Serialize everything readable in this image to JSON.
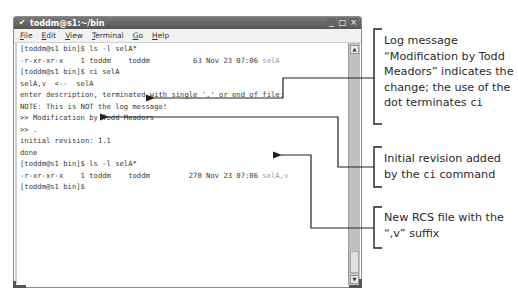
{
  "window": {
    "title": "toddm@s1:~/bin",
    "menu": [
      {
        "label": "File",
        "mnemonic": "F",
        "rest": "ile"
      },
      {
        "label": "Edit",
        "mnemonic": "E",
        "rest": "dit"
      },
      {
        "label": "View",
        "mnemonic": "V",
        "rest": "iew"
      },
      {
        "label": "Terminal",
        "mnemonic": "T",
        "rest": "erminal"
      },
      {
        "label": "Go",
        "mnemonic": "G",
        "rest": "o"
      },
      {
        "label": "Help",
        "mnemonic": "H",
        "rest": "elp"
      }
    ],
    "controls": {
      "minimize": "_",
      "maximize": "□",
      "close": "×"
    }
  },
  "terminal": {
    "lines": [
      {
        "text": "[toddm@s1 bin]$ ls -l selA*"
      },
      {
        "text": "-r-xr-xr-x    1 toddm    toddm          63 Nov 23 07:06 ",
        "dim": "selA"
      },
      {
        "text": "[toddm@s1 bin]$ ci selA"
      },
      {
        "text": "selA,v  <--  selA"
      },
      {
        "text": "enter description, terminated with single '.' or end of file:"
      },
      {
        "text": "NOTE: This is NOT the log message!"
      },
      {
        "text": ">> Modification by Todd Meadors"
      },
      {
        "text": ">> ."
      },
      {
        "text": "initial revision: 1.1"
      },
      {
        "text": "done"
      },
      {
        "text": "[toddm@s1 bin]$ ls -l selA*"
      },
      {
        "text": "-r-xr-xr-x    1 toddm    toddm         270 Nov 23 07:06 ",
        "dim": "selA,v"
      },
      {
        "text": "[toddm@s1 bin]$"
      }
    ]
  },
  "annotations": [
    {
      "text_before": "Log message “Modification by Todd Meadors” indicates the change; the use of the dot terminates ",
      "code": "ci",
      "text_after": ""
    },
    {
      "text_before": "Initial revision added by the ",
      "code": "ci",
      "text_after": " command"
    },
    {
      "text_before": "New RCS file with the “,v” suffix",
      "code": "",
      "text_after": ""
    }
  ]
}
